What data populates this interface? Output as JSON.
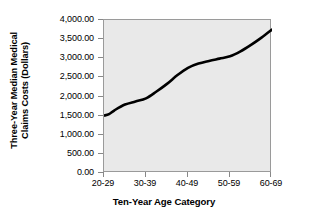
{
  "chart_data": {
    "type": "line",
    "title": "",
    "xlabel": "Ten-Year Age Category",
    "ylabel_line1": "Three-Year Median Medical",
    "ylabel_line2": "Claims Costs (Dollars)",
    "ylabel": "Three-Year Median Medical Claims Costs (Dollars)",
    "categories": [
      "20-29",
      "30-39",
      "40-49",
      "50-59",
      "60-69"
    ],
    "values": [
      1500,
      1950,
      2750,
      3050,
      3750
    ],
    "series": [
      {
        "name": "Three-Year Median Medical Claims Costs",
        "values": [
          1500,
          1950,
          2750,
          3050,
          3750
        ]
      }
    ],
    "ylim": [
      0,
      4000
    ],
    "ytick_values": [
      0,
      500,
      1000,
      1500,
      2000,
      2500,
      3000,
      3500,
      4000
    ],
    "ytick_labels": [
      "0.00",
      "500.00",
      "1,000.00",
      "1,500.00",
      "2,000.00",
      "2,500.00",
      "3,000.00",
      "3,500.00",
      "4,000.00"
    ],
    "grid": false,
    "legend": "none",
    "line_color": "#000000",
    "line_width": 2.6,
    "plot_background": "#e9e9e9",
    "plot_border_color": "#9a9a9a",
    "figure_background": "#ffffff",
    "smoothing": "s-curve",
    "curve_points": [
      {
        "x": 0.0,
        "y": 1500
      },
      {
        "x": 0.12,
        "y": 1540
      },
      {
        "x": 0.25,
        "y": 1640
      },
      {
        "x": 0.5,
        "y": 1790
      },
      {
        "x": 0.75,
        "y": 1870
      },
      {
        "x": 1.0,
        "y": 1950
      },
      {
        "x": 1.25,
        "y": 2130
      },
      {
        "x": 1.5,
        "y": 2330
      },
      {
        "x": 1.75,
        "y": 2560
      },
      {
        "x": 2.0,
        "y": 2750
      },
      {
        "x": 2.25,
        "y": 2860
      },
      {
        "x": 2.5,
        "y": 2930
      },
      {
        "x": 2.75,
        "y": 2990
      },
      {
        "x": 3.0,
        "y": 3050
      },
      {
        "x": 3.25,
        "y": 3180
      },
      {
        "x": 3.5,
        "y": 3350
      },
      {
        "x": 3.75,
        "y": 3540
      },
      {
        "x": 4.0,
        "y": 3750
      }
    ]
  }
}
